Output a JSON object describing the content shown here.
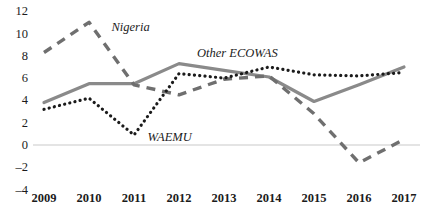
{
  "chart_data": {
    "type": "line",
    "title": "",
    "xlabel": "",
    "ylabel": "",
    "categories": [
      2009,
      2010,
      2011,
      2012,
      2013,
      2014,
      2015,
      2016,
      2017
    ],
    "x_tick_labels": [
      "2009",
      "2010",
      "2011",
      "2012",
      "2013",
      "2014",
      "2015",
      "2016",
      "2017"
    ],
    "y_tick_labels": [
      "12",
      "10",
      "8",
      "6",
      "4",
      "2",
      "0",
      "-2",
      "-4"
    ],
    "y_tick_values": [
      12,
      10,
      8,
      6,
      4,
      2,
      0,
      -2,
      -4
    ],
    "ylim": [
      -4,
      12
    ],
    "xlim": [
      2009,
      2017
    ],
    "grid": false,
    "zero_line": true,
    "legend_position": "inline-annotations",
    "series": [
      {
        "name": "Nigeria",
        "style": "dashed",
        "color": "#6f6f6f",
        "values": [
          8.3,
          11.0,
          5.4,
          4.5,
          5.9,
          6.2,
          2.8,
          -1.6,
          0.5
        ]
      },
      {
        "name": "Other ECOWAS",
        "style": "solid",
        "color": "#8a8a8a",
        "values": [
          3.8,
          5.5,
          5.5,
          7.3,
          6.7,
          6.1,
          3.9,
          5.4,
          7.0
        ]
      },
      {
        "name": "WAEMU",
        "style": "dotted",
        "color": "#1b1b1b",
        "values": [
          3.2,
          4.2,
          0.9,
          6.4,
          6.0,
          7.0,
          6.3,
          6.2,
          6.5
        ]
      }
    ],
    "annotations": [
      {
        "text": "Nigeria",
        "x": 2010.5,
        "y": 10.5
      },
      {
        "text": "Other ECOWAS",
        "x": 2012.4,
        "y": 8.2
      },
      {
        "text": "WAEMU",
        "x": 2011.3,
        "y": 0.6
      }
    ]
  },
  "axis": {
    "y_ticks": [
      {
        "label": "12",
        "value": 12
      },
      {
        "label": "10",
        "value": 10
      },
      {
        "label": "8",
        "value": 8
      },
      {
        "label": "6",
        "value": 6
      },
      {
        "label": "4",
        "value": 4
      },
      {
        "label": "2",
        "value": 2
      },
      {
        "label": "0",
        "value": 0
      },
      {
        "label": "–2",
        "value": -2
      },
      {
        "label": "–4",
        "value": -4
      }
    ],
    "x_ticks": [
      {
        "label": "2009"
      },
      {
        "label": "2010"
      },
      {
        "label": "2011"
      },
      {
        "label": "2012"
      },
      {
        "label": "2013"
      },
      {
        "label": "2014"
      },
      {
        "label": "2015"
      },
      {
        "label": "2016"
      },
      {
        "label": "2017"
      }
    ]
  },
  "colors": {
    "nigeria": "#6f6f6f",
    "other_ecowas": "#8a8a8a",
    "waemu": "#1b1b1b",
    "zero_line": "#c9c9c9",
    "text": "#1b1b1b",
    "background": "#ffffff"
  },
  "labels": {
    "nigeria": "Nigeria",
    "other_ecowas": "Other ECOWAS",
    "waemu": "WAEMU"
  }
}
